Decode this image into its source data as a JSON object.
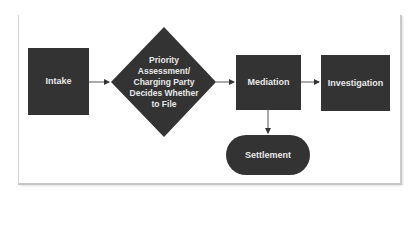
{
  "diagram": {
    "type": "flowchart",
    "colors": {
      "node_fill": "#333333",
      "node_text": "#e8e8e8",
      "edge": "#444444",
      "background": "#ffffff"
    },
    "nodes": [
      {
        "id": "intake",
        "shape": "rectangle",
        "label": "Intake"
      },
      {
        "id": "priority",
        "shape": "diamond",
        "label": "Priority Assessment/ Charging Party Decides Whether to File"
      },
      {
        "id": "mediation",
        "shape": "rectangle",
        "label": "Mediation"
      },
      {
        "id": "investigation",
        "shape": "rectangle",
        "label": "Investigation"
      },
      {
        "id": "settlement",
        "shape": "pill",
        "label": "Settlement"
      }
    ],
    "edges": [
      {
        "from": "intake",
        "to": "priority"
      },
      {
        "from": "priority",
        "to": "mediation"
      },
      {
        "from": "mediation",
        "to": "investigation"
      },
      {
        "from": "mediation",
        "to": "settlement"
      }
    ]
  }
}
